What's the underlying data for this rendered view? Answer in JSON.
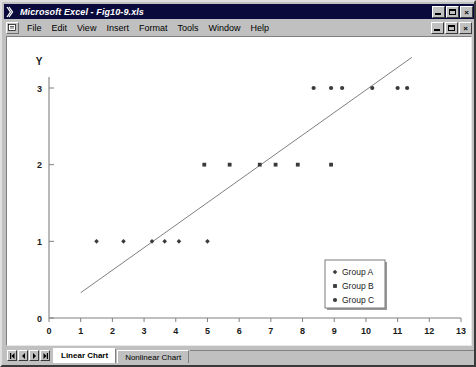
{
  "window": {
    "title": "Microsoft Excel - Fig10-9.xls",
    "app_icon": "excel-x-icon",
    "controls": {
      "minimize": "minimize-button",
      "restore": "restore-button",
      "close": "close-button",
      "close_glyph": "×"
    }
  },
  "menu": {
    "document_icon": "document-icon",
    "items": [
      {
        "label": "File"
      },
      {
        "label": "Edit"
      },
      {
        "label": "View"
      },
      {
        "label": "Insert"
      },
      {
        "label": "Format"
      },
      {
        "label": "Tools"
      },
      {
        "label": "Window"
      },
      {
        "label": "Help"
      }
    ],
    "controls": {
      "minimize": "doc-minimize-button",
      "restore": "doc-restore-button",
      "close": "doc-close-button",
      "close_glyph": "×"
    }
  },
  "tabs": {
    "nav_first": "first-sheet-button",
    "nav_prev": "previous-sheet-button",
    "nav_next": "next-sheet-button",
    "nav_last": "last-sheet-button",
    "sheets": [
      {
        "label": "Linear Chart",
        "active": true
      },
      {
        "label": "Nonlinear Chart",
        "active": false
      }
    ]
  },
  "chart_data": {
    "type": "scatter",
    "title": "",
    "xlabel": "X",
    "ylabel": "Y",
    "xlim": [
      0,
      13
    ],
    "ylim": [
      0,
      3.55
    ],
    "xticks": [
      0,
      1,
      2,
      3,
      4,
      5,
      6,
      7,
      8,
      9,
      10,
      11,
      12,
      13
    ],
    "xtick_labels": [
      "0",
      "1",
      "2",
      "3",
      "4",
      "5",
      "6",
      "7",
      "8",
      "9",
      "10",
      "11",
      "12",
      "13"
    ],
    "yticks": [
      0,
      1,
      2,
      3
    ],
    "ytick_labels": [
      "0",
      "1",
      "2",
      "3"
    ],
    "grid": false,
    "legend_position": "inside-right",
    "axis_color": "#808080",
    "marker_color": "#3a3a3a",
    "trendline_color": "#808080",
    "series": [
      {
        "name": "Group A",
        "marker": "diamond",
        "points": [
          {
            "x": 1.5,
            "y": 1
          },
          {
            "x": 2.35,
            "y": 1
          },
          {
            "x": 3.25,
            "y": 1
          },
          {
            "x": 3.65,
            "y": 1
          },
          {
            "x": 4.1,
            "y": 1
          },
          {
            "x": 5.0,
            "y": 1
          }
        ]
      },
      {
        "name": "Group B",
        "marker": "square",
        "points": [
          {
            "x": 4.9,
            "y": 2
          },
          {
            "x": 5.7,
            "y": 2
          },
          {
            "x": 6.65,
            "y": 2
          },
          {
            "x": 7.15,
            "y": 2
          },
          {
            "x": 7.85,
            "y": 2
          },
          {
            "x": 8.9,
            "y": 2
          }
        ]
      },
      {
        "name": "Group C",
        "marker": "circle",
        "points": [
          {
            "x": 8.35,
            "y": 3
          },
          {
            "x": 8.9,
            "y": 3
          },
          {
            "x": 9.25,
            "y": 3
          },
          {
            "x": 10.2,
            "y": 3
          },
          {
            "x": 11.0,
            "y": 3
          },
          {
            "x": 11.3,
            "y": 3
          }
        ]
      }
    ],
    "trendline": {
      "name": "linear-trendline",
      "x0": 1.0,
      "y0": 0.33,
      "x1": 11.45,
      "y1": 3.4
    },
    "legend": {
      "entries": [
        {
          "label": "Group A",
          "marker": "diamond"
        },
        {
          "label": "Group B",
          "marker": "square"
        },
        {
          "label": "Group C",
          "marker": "circle"
        }
      ]
    }
  }
}
